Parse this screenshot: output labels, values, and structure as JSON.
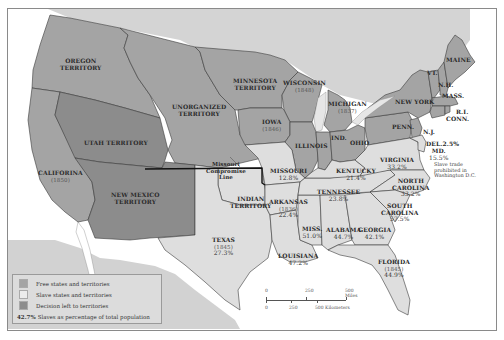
{
  "map": {
    "colors": {
      "free": "#a4a4a4",
      "slave": "#dedede",
      "decision": "#8c8c8c",
      "foreign_land": "#d2d2d2",
      "water": "#ffffff",
      "border": "#3a3a3a",
      "compromise_line": "#111111"
    },
    "regions": [
      {
        "name": "OREGON TERRITORY",
        "lines": [
          "OREGON",
          "TERRITORY"
        ],
        "category": "free"
      },
      {
        "name": "UNORGANIZED TERRITORY",
        "lines": [
          "UNORGANIZED",
          "TERRITORY"
        ],
        "category": "free"
      },
      {
        "name": "MINNESOTA TERRITORY",
        "lines": [
          "MINNESOTA",
          "TERRITORY"
        ],
        "category": "free"
      },
      {
        "name": "WISCONSIN",
        "lines": [
          "WISCONSIN"
        ],
        "year": "(1848)",
        "category": "free"
      },
      {
        "name": "MICHIGAN",
        "lines": [
          "MICHIGAN"
        ],
        "year": "(1837)",
        "category": "free"
      },
      {
        "name": "IOWA",
        "lines": [
          "IOWA"
        ],
        "year": "(1846)",
        "category": "free"
      },
      {
        "name": "ILLINOIS",
        "lines": [
          "ILLINOIS"
        ],
        "category": "free"
      },
      {
        "name": "IND.",
        "lines": [
          "IND."
        ],
        "category": "free"
      },
      {
        "name": "OHIO",
        "lines": [
          "OHIO"
        ],
        "category": "free"
      },
      {
        "name": "PENN.",
        "lines": [
          "PENN."
        ],
        "category": "free"
      },
      {
        "name": "NEW YORK",
        "lines": [
          "NEW YORK"
        ],
        "category": "free"
      },
      {
        "name": "VT.",
        "lines": [
          "VT."
        ],
        "category": "free"
      },
      {
        "name": "N.H.",
        "lines": [
          "N.H."
        ],
        "category": "free"
      },
      {
        "name": "MAINE",
        "lines": [
          "MAINE"
        ],
        "category": "free"
      },
      {
        "name": "MASS.",
        "lines": [
          "MASS."
        ],
        "category": "free"
      },
      {
        "name": "R.I.",
        "lines": [
          "R.I."
        ],
        "category": "free"
      },
      {
        "name": "CONN.",
        "lines": [
          "CONN."
        ],
        "category": "free"
      },
      {
        "name": "N.J.",
        "lines": [
          "N.J."
        ],
        "category": "free"
      },
      {
        "name": "CALIFORNIA",
        "lines": [
          "CALIFORINA"
        ],
        "year": "(1850)",
        "category": "free"
      },
      {
        "name": "UTAH TERRITORY",
        "lines": [
          "UTAH TERRITORY"
        ],
        "category": "decision"
      },
      {
        "name": "NEW MEXICO TERRITORY",
        "lines": [
          "NEW MEXICO",
          "TERRITORY"
        ],
        "category": "decision"
      },
      {
        "name": "INDIAN TERRITORY",
        "lines": [
          "INDIAN",
          "TERRITORY"
        ],
        "category": "slave"
      },
      {
        "name": "TEXAS",
        "lines": [
          "TEXAS"
        ],
        "year": "(1845)",
        "pct": "27.3%",
        "category": "slave"
      },
      {
        "name": "MISSOURI",
        "lines": [
          "MISSOURI"
        ],
        "pct": "12.8%",
        "category": "slave"
      },
      {
        "name": "ARKANSAS",
        "lines": [
          "ARKANSAS"
        ],
        "year": "(1836)",
        "pct": "22.4%",
        "category": "slave"
      },
      {
        "name": "LOUISIANA",
        "lines": [
          "LOUISIANA"
        ],
        "pct": "47.2%",
        "category": "slave"
      },
      {
        "name": "MISS.",
        "lines": [
          "MISS."
        ],
        "pct": "51.0%",
        "category": "slave"
      },
      {
        "name": "ALABAMA",
        "lines": [
          "ALABAMA"
        ],
        "pct": "44.7%",
        "category": "slave"
      },
      {
        "name": "GEORGIA",
        "lines": [
          "GEORGIA"
        ],
        "pct": "42.1%",
        "category": "slave"
      },
      {
        "name": "FLORIDA",
        "lines": [
          "FLORIDA"
        ],
        "year": "(1845)",
        "pct": "44.9%",
        "category": "slave"
      },
      {
        "name": "TENNESSEE",
        "lines": [
          "TENNESSEE"
        ],
        "pct": "23.8%",
        "category": "slave"
      },
      {
        "name": "KENTUCKY",
        "lines": [
          "KENTUCKY"
        ],
        "pct": "21.4%",
        "category": "slave"
      },
      {
        "name": "VIRGINIA",
        "lines": [
          "VIRGINIA"
        ],
        "pct": "33.2%",
        "category": "slave"
      },
      {
        "name": "NORTH CAROLINA",
        "lines": [
          "NORTH",
          "CAROLINA"
        ],
        "pct": "33.2%",
        "category": "slave"
      },
      {
        "name": "SOUTH CAROLINA",
        "lines": [
          "SOUTH",
          "CAROLINA"
        ],
        "pct": "57.5%",
        "category": "slave"
      },
      {
        "name": "DEL.",
        "lines": [
          "DEL."
        ],
        "pct": "2.5%",
        "category": "slave"
      },
      {
        "name": "MD.",
        "lines": [
          "MD."
        ],
        "pct": "15.5%",
        "category": "slave"
      }
    ],
    "annotations": {
      "compromise": [
        "Missouri",
        "Compromise",
        "Line"
      ],
      "dc_note": [
        "Slave trade",
        "prohibited in",
        "Washington D.C."
      ]
    },
    "legend": {
      "items": [
        {
          "label": "Free states and territories",
          "category": "free"
        },
        {
          "label": "Slave states and territories",
          "category": "slave"
        },
        {
          "label": "Decision left to territories",
          "category": "decision"
        }
      ],
      "pct_example": "42.7%",
      "pct_label": "Slaves as percentage of total population"
    },
    "scale": {
      "miles_ticks": [
        "0",
        "250",
        "500 Miles"
      ],
      "km_ticks": [
        "0",
        "250",
        "500 Kilometers"
      ]
    }
  }
}
